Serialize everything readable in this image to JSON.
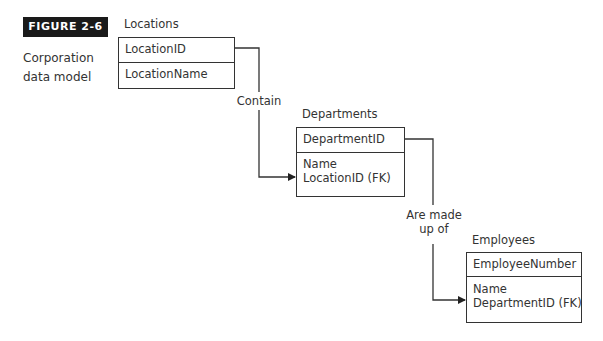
{
  "figure": {
    "badge": "FIGURE 2-6",
    "caption": "Corporation data model"
  },
  "entities": [
    {
      "name": "Locations",
      "primary_key": "LocationID",
      "attributes": [
        "LocationName"
      ]
    },
    {
      "name": "Departments",
      "primary_key": "DepartmentID",
      "attributes": [
        "Name",
        "LocationID (FK)"
      ]
    },
    {
      "name": "Employees",
      "primary_key": "EmployeeNumber",
      "attributes": [
        "Name",
        "DepartmentID (FK)"
      ]
    }
  ],
  "relationships": [
    {
      "from": "Locations",
      "to": "Departments",
      "label_lines": [
        "Contain"
      ]
    },
    {
      "from": "Departments",
      "to": "Employees",
      "label_lines": [
        "Are made",
        "up of"
      ]
    }
  ]
}
